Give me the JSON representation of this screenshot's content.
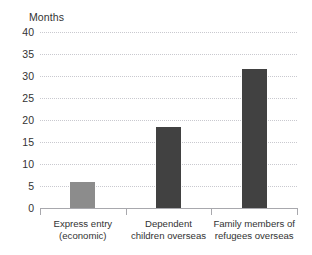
{
  "chart_data": {
    "type": "bar",
    "title": "",
    "subtitle": "",
    "xlabel": "",
    "ylabel": "Months",
    "ylim": [
      0,
      40
    ],
    "ytick_step": 5,
    "yticks": [
      40,
      35,
      30,
      25,
      20,
      15,
      10,
      5,
      0
    ],
    "grid": true,
    "legend": false,
    "categories": [
      "Express entry (economic)",
      "Dependent children overseas",
      "Family members of refugees overseas"
    ],
    "category_lines": [
      [
        "Express entry",
        "(economic)"
      ],
      [
        "Dependent",
        "children overseas"
      ],
      [
        "Family members of",
        "refugees overseas"
      ]
    ],
    "values": [
      6,
      18.5,
      31.5
    ],
    "bar_colors": [
      "#8c8c8c",
      "#414141",
      "#414141"
    ],
    "colors": {
      "bar_light": "#8c8c8c",
      "bar_dark": "#414141",
      "gridline": "#c9c9cf",
      "axis": "#a8a8ad",
      "text": "#333333",
      "background": "#ffffff"
    }
  }
}
